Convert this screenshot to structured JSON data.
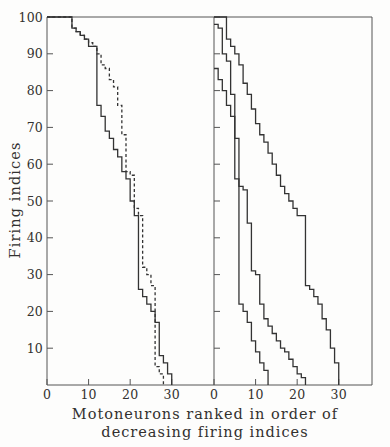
{
  "chart_data": {
    "type": "line",
    "title": "",
    "subtitle": "",
    "xlabel": "Motoneurons ranked in order of decreasing firing indices",
    "ylabel": "Firing indices",
    "grid": false,
    "legend_position": "none",
    "line_style_note": "step (staircase) curves",
    "panels": [
      {
        "name": "left-panel",
        "xlim": [
          0,
          38
        ],
        "ylim": [
          0,
          100
        ],
        "xticks": [
          0,
          10,
          20,
          30
        ],
        "xtick_labels": [
          "0",
          "10",
          "20",
          "30"
        ],
        "yticks": [
          10,
          20,
          30,
          40,
          50,
          60,
          70,
          80,
          90,
          100
        ],
        "ytick_labels": [
          "10",
          "20",
          "30",
          "40",
          "50",
          "60",
          "70",
          "80",
          "90",
          "100"
        ],
        "series": [
          {
            "name": "solid-curve-left",
            "style": "solid",
            "color": "#333333",
            "x": [
              0,
              5,
              6,
              7,
              8,
              9,
              10,
              11,
              12,
              13,
              14,
              15,
              16,
              17,
              18,
              19,
              20,
              21,
              22,
              23,
              24,
              25,
              26,
              27,
              28,
              29,
              30
            ],
            "y": [
              100,
              100,
              97,
              96,
              95,
              94,
              92,
              92,
              76,
              73,
              69,
              67,
              64,
              62,
              58,
              56,
              50,
              46,
              26,
              24,
              22,
              20,
              17,
              8,
              6,
              3,
              2
            ]
          },
          {
            "name": "dashed-curve-left",
            "style": "dashed",
            "color": "#333333",
            "x": [
              0,
              5,
              6,
              7,
              8,
              9,
              10,
              11,
              12,
              13,
              14,
              15,
              16,
              17,
              18,
              19,
              20,
              21,
              22,
              23,
              24,
              25,
              26,
              27,
              28
            ],
            "y": [
              100,
              100,
              97,
              96,
              95,
              94,
              93,
              92,
              90,
              87,
              86,
              83,
              81,
              76,
              68,
              58,
              57,
              48,
              46,
              32,
              30,
              27,
              5,
              3,
              1
            ]
          }
        ]
      },
      {
        "name": "right-panel",
        "xlim": [
          0,
          38
        ],
        "ylim": [
          0,
          100
        ],
        "xticks": [
          0,
          10,
          20,
          30
        ],
        "xtick_labels": [
          "0",
          "10",
          "20",
          "30"
        ],
        "yticks": [
          10,
          20,
          30,
          40,
          50,
          60,
          70,
          80,
          90,
          100
        ],
        "ytick_labels": [],
        "series": [
          {
            "name": "solid-curve-right-a",
            "style": "solid",
            "color": "#333333",
            "x": [
              0,
              1,
              2,
              3,
              4,
              5,
              6,
              7,
              8,
              9,
              10,
              11,
              12,
              13
            ],
            "y": [
              86,
              83,
              80,
              76,
              73,
              56,
              22,
              20,
              17,
              12,
              9,
              6,
              4,
              1
            ]
          },
          {
            "name": "solid-curve-right-b",
            "style": "solid",
            "color": "#333333",
            "x": [
              0,
              1,
              2,
              3,
              4,
              5,
              6,
              7,
              8,
              9,
              10,
              11,
              12,
              13,
              14,
              15,
              16,
              17,
              18,
              19,
              20,
              21,
              22
            ],
            "y": [
              98,
              97,
              90,
              88,
              79,
              67,
              54,
              53,
              44,
              31,
              30,
              22,
              18,
              16,
              14,
              12,
              10,
              9,
              7,
              5,
              3,
              2,
              2
            ]
          },
          {
            "name": "solid-curve-right-c",
            "style": "solid",
            "color": "#333333",
            "x": [
              0,
              2,
              3,
              4,
              5,
              6,
              7,
              8,
              9,
              10,
              11,
              12,
              13,
              14,
              15,
              16,
              17,
              18,
              19,
              20,
              21,
              22,
              23,
              24,
              25,
              26,
              27,
              28,
              29,
              30
            ],
            "y": [
              100,
              100,
              94,
              92,
              90,
              87,
              82,
              79,
              75,
              71,
              68,
              66,
              63,
              60,
              57,
              54,
              52,
              50,
              48,
              46,
              46,
              27,
              26,
              24,
              22,
              18,
              15,
              10,
              6,
              3
            ]
          }
        ]
      }
    ]
  },
  "axis": {
    "y_title": "Firing indices",
    "left_xtick_labels": [
      "0",
      "10",
      "20",
      "30"
    ],
    "right_xtick_labels": [
      "0",
      "10",
      "20",
      "30"
    ],
    "ytick_labels": [
      "10",
      "20",
      "30",
      "40",
      "50",
      "60",
      "70",
      "80",
      "90",
      "100"
    ]
  },
  "caption": {
    "line1": "Motoneurons ranked in order of",
    "line2": "decreasing firing indices"
  },
  "colors": {
    "ink": "#333333",
    "background": "#fdfdfc"
  }
}
